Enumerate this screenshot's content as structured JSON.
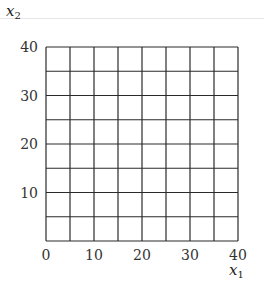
{
  "chart_data": {
    "type": "grid",
    "title": "",
    "xlabel": "x1",
    "ylabel": "x2",
    "xlabel_main": "x",
    "xlabel_sub": "1",
    "ylabel_main": "x",
    "ylabel_sub": "2",
    "xlim": [
      0,
      40
    ],
    "ylim": [
      0,
      40
    ],
    "grid": true,
    "grid_step": 5,
    "grid_divisions": 8,
    "x_ticks": [
      0,
      10,
      20,
      30,
      40
    ],
    "y_ticks": [
      0,
      10,
      20,
      30,
      40
    ],
    "x_tick_labels": [
      "0",
      "10",
      "20",
      "30",
      "40"
    ],
    "y_tick_labels": [
      "10",
      "20",
      "30",
      "40"
    ],
    "series": []
  },
  "colors": {
    "grid_line": "#2a2a2a",
    "text": "#333333",
    "top_rule": "#e6e6e6"
  }
}
